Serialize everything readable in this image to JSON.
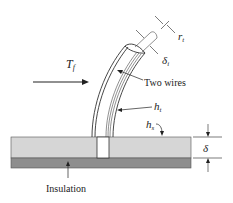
{
  "diagram": {
    "labels": {
      "fluid_temp": "T",
      "fluid_temp_sub": "f",
      "two_wires": "Two wires",
      "h_tube": "h",
      "h_tube_sub": "t",
      "h_surface": "h",
      "h_surface_sub": "s",
      "thickness": "δ",
      "insulation": "Insulation",
      "r_tube": "r",
      "r_tube_sub": "t",
      "delta_insul": "δ",
      "delta_insul_sub": "i"
    },
    "colors": {
      "plate": "#d6d6d6",
      "insulation": "#8e8e8e",
      "line": "#333333",
      "background": "#ffffff"
    }
  }
}
